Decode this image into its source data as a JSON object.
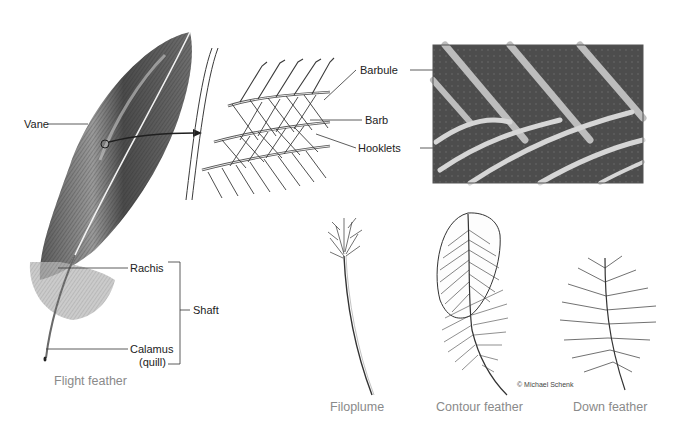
{
  "diagram": {
    "flight_feather": {
      "caption": "Flight feather",
      "labels": {
        "vane": "Vane",
        "rachis": "Rachis",
        "shaft": "Shaft",
        "calamus": "Calamus",
        "quill": "(quill)"
      }
    },
    "detail": {
      "labels": {
        "barbule": "Barbule",
        "barb": "Barb",
        "hooklets": "Hooklets"
      }
    },
    "micrograph": {
      "description": "Electron micrograph of barbs and hooklets"
    },
    "feather_types": [
      {
        "name": "Filoplume"
      },
      {
        "name": "Contour feather"
      },
      {
        "name": "Down feather"
      }
    ],
    "credit": "© Michael Schenk",
    "colors": {
      "line": "#333333",
      "caption": "#8a8a8a",
      "feather_dark": "#3a3a3a",
      "feather_mid": "#8c8c8c",
      "micrograph_bg": "#4a4a4a"
    }
  }
}
